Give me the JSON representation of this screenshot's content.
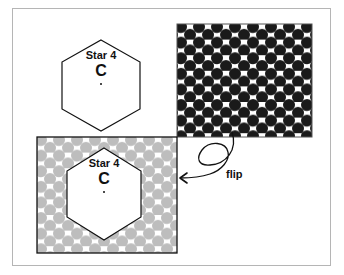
{
  "diagram": {
    "top_tile": {
      "label": "Star 4",
      "letter": "C"
    },
    "bottom_tile": {
      "label": "Star 4",
      "letter": "C"
    },
    "arrow_label": "flip",
    "colors": {
      "dark_dots": "#1a1a1a",
      "light_dots": "#bdbdbd",
      "frame": "#b5b5b5",
      "outline": "#111111"
    }
  }
}
